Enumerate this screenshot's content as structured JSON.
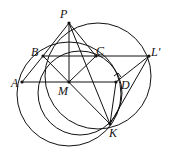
{
  "diagram": {
    "type": "geometry",
    "points": {
      "P": {
        "label": "P",
        "x": 69,
        "y": 23,
        "lx": 60,
        "ly": 8
      },
      "B": {
        "label": "B",
        "x": 43,
        "y": 56,
        "lx": 31,
        "ly": 46
      },
      "C": {
        "label": "C",
        "x": 96,
        "y": 56,
        "lx": 96,
        "ly": 45
      },
      "L": {
        "label": "L'",
        "x": 149,
        "y": 56,
        "lx": 151,
        "ly": 46
      },
      "A": {
        "label": "A",
        "x": 22,
        "y": 82,
        "lx": 11,
        "ly": 77
      },
      "M": {
        "label": "M",
        "x": 69,
        "y": 82,
        "lx": 58,
        "ly": 85
      },
      "D": {
        "label": "D",
        "x": 116,
        "y": 82,
        "lx": 121,
        "ly": 79
      },
      "K": {
        "label": "K",
        "x": 110,
        "y": 124,
        "lx": 109,
        "ly": 127
      }
    },
    "segments": [
      [
        "A",
        "D"
      ],
      [
        "B",
        "L"
      ],
      [
        "P",
        "M"
      ],
      [
        "P",
        "B"
      ],
      [
        "P",
        "C"
      ],
      [
        "P",
        "K"
      ],
      [
        "B",
        "K"
      ],
      [
        "M",
        "C"
      ],
      [
        "D",
        "L"
      ],
      [
        "L",
        "K"
      ],
      [
        "D",
        "K"
      ],
      [
        "A",
        "B"
      ]
    ],
    "circles": [
      {
        "cx": 69,
        "cy": 94,
        "r": 52
      },
      {
        "cx": 98,
        "cy": 76,
        "r": 53
      },
      {
        "cx": 80,
        "cy": 93,
        "r": 42
      }
    ],
    "right_angle_at": "D"
  }
}
